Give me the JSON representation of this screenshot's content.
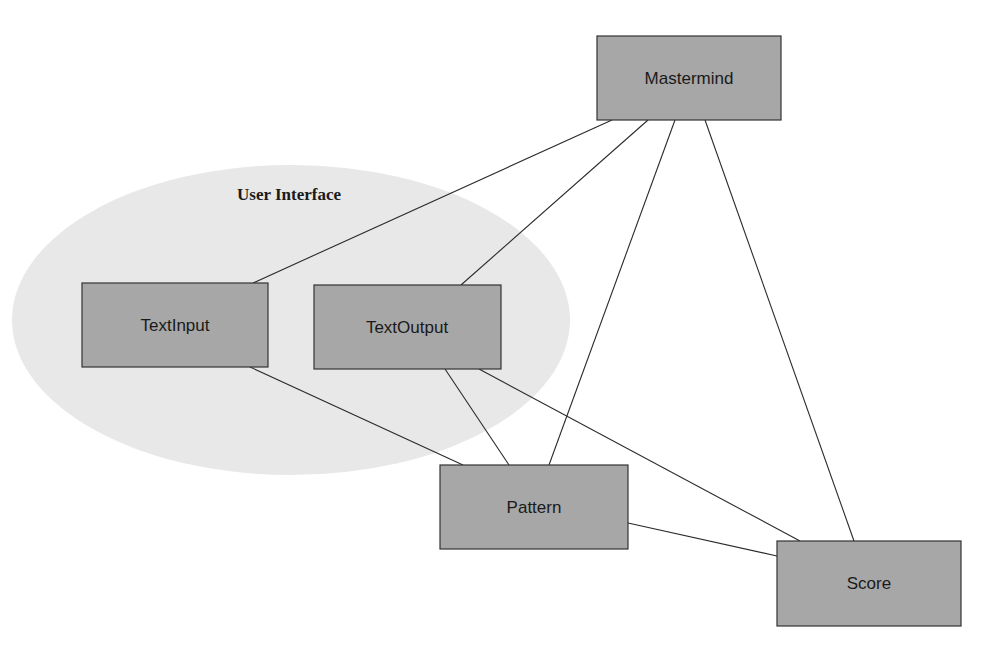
{
  "header": {
    "corner_text": ""
  },
  "diagram": {
    "group": {
      "label": "User Interface",
      "fill": "#e8e8e8"
    },
    "nodes": [
      {
        "id": "mastermind",
        "label": "Mastermind"
      },
      {
        "id": "textinput",
        "label": "TextInput"
      },
      {
        "id": "textoutput",
        "label": "TextOutput"
      },
      {
        "id": "pattern",
        "label": "Pattern"
      },
      {
        "id": "score",
        "label": "Score"
      }
    ],
    "edges": [
      {
        "from": "Mastermind",
        "to": "TextInput"
      },
      {
        "from": "Mastermind",
        "to": "TextOutput"
      },
      {
        "from": "Mastermind",
        "to": "Pattern"
      },
      {
        "from": "Mastermind",
        "to": "Score"
      },
      {
        "from": "TextInput",
        "to": "Pattern"
      },
      {
        "from": "TextOutput",
        "to": "Pattern"
      },
      {
        "from": "TextOutput",
        "to": "Score"
      },
      {
        "from": "Pattern",
        "to": "Score"
      }
    ],
    "colors": {
      "node_fill": "#a7a7a7",
      "node_stroke": "#333333",
      "edge": "#2a2a2a",
      "background": "#ffffff"
    }
  }
}
